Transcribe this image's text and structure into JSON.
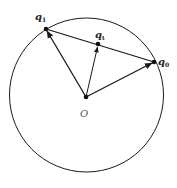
{
  "diagram": {
    "title": "",
    "circle": {
      "cx": 86.5,
      "cy": 95,
      "r": 77
    },
    "points": {
      "origin": {
        "label": "O",
        "x": 86,
        "y": 97
      },
      "q1": {
        "label": "q",
        "sub": "1",
        "x": 46,
        "y": 29
      },
      "qt": {
        "label": "q",
        "sub": "t",
        "x": 98,
        "y": 44
      },
      "q0": {
        "label": "q",
        "sub": "0",
        "x": 154,
        "y": 62
      }
    },
    "vectors": [
      {
        "from": "origin",
        "to": "q1"
      },
      {
        "from": "origin",
        "to": "qt"
      },
      {
        "from": "origin",
        "to": "q0"
      }
    ],
    "chord": {
      "from": "q1",
      "to": "q0"
    },
    "colors": {
      "stroke": "#1a1a1a",
      "label": "#222222"
    }
  }
}
